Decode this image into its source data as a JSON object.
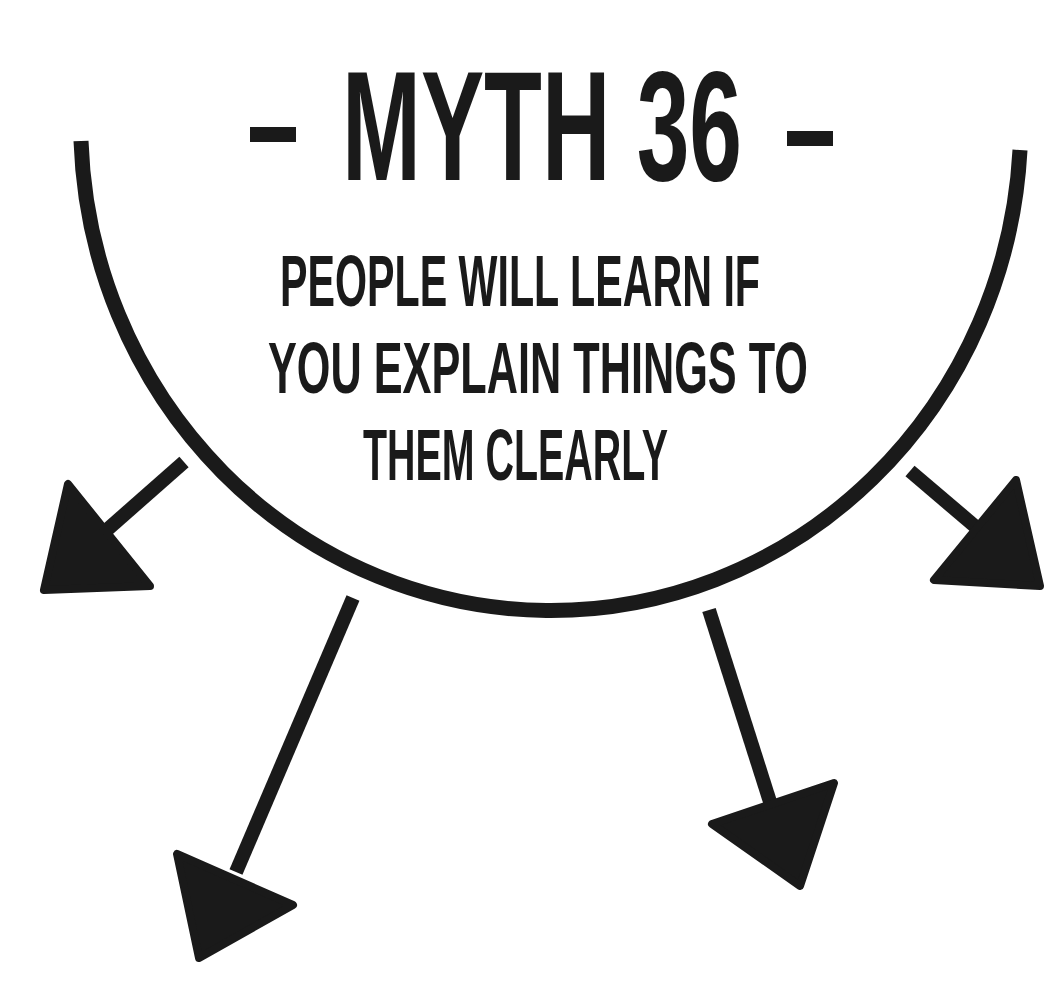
{
  "colors": {
    "ink": "#1a1a1a",
    "background": "#ffffff"
  },
  "title": {
    "text": "- MYTH 36 -",
    "dash_left": "-",
    "label": "MYTH 36",
    "dash_right": "-"
  },
  "statement": {
    "lines": [
      "PEOPLE WILL LEARN IF",
      "YOU EXPLAIN THINGS TO",
      "THEM CLEARLY"
    ]
  },
  "diagram": {
    "arc": {
      "shape": "half-ellipse-bowl",
      "center": [
        551,
        145
      ],
      "rx": 470,
      "ry": 487,
      "stroke_width": 15
    },
    "arrows": [
      {
        "name": "arrow-left",
        "from": [
          182,
          463
        ],
        "to": [
          100,
          535
        ],
        "head": [
          [
            68,
            484
          ],
          [
            44,
            590
          ],
          [
            150,
            586
          ]
        ]
      },
      {
        "name": "arrow-bottom-left",
        "from": [
          352,
          600
        ],
        "to": [
          240,
          868
        ],
        "head": [
          [
            177,
            854
          ],
          [
            199,
            958
          ],
          [
            293,
            905
          ]
        ]
      },
      {
        "name": "arrow-bottom-right",
        "from": [
          710,
          612
        ],
        "to": [
          768,
          800
        ],
        "head": [
          [
            712,
            824
          ],
          [
            834,
            783
          ],
          [
            800,
            886
          ]
        ]
      },
      {
        "name": "arrow-right",
        "from": [
          912,
          473
        ],
        "to": [
          980,
          530
        ],
        "head": [
          [
            1016,
            480
          ],
          [
            934,
            580
          ],
          [
            1040,
            586
          ]
        ]
      }
    ]
  }
}
